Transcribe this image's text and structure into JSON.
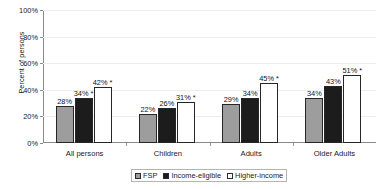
{
  "chart_data": {
    "type": "bar",
    "title": "",
    "xlabel": "",
    "ylabel": "Percent of persons",
    "ylim": [
      0,
      100
    ],
    "grid": true,
    "legend_position": "bottom",
    "categories": [
      "All persons",
      "Children",
      "Adults",
      "Older Adults"
    ],
    "ytick_labels": [
      "0%",
      "20%",
      "40%",
      "60%",
      "80%",
      "100%"
    ],
    "ytick_values": [
      0,
      20,
      40,
      60,
      80,
      100
    ],
    "series": [
      {
        "name": "FSP",
        "color": "#9d9d9d",
        "values": [
          28,
          22,
          29,
          34
        ],
        "labels": [
          "28%",
          "22%",
          "29%",
          "34%"
        ]
      },
      {
        "name": "Income-eligible",
        "color": "#1c1c1c",
        "values": [
          34,
          26,
          34,
          43
        ],
        "labels": [
          "34% *",
          "26%",
          "34%",
          "43%"
        ]
      },
      {
        "name": "Higher-income",
        "color": "#ffffff",
        "values": [
          42,
          31,
          45,
          51
        ],
        "labels": [
          "42% *",
          "31% *",
          "45% *",
          "51% *"
        ]
      }
    ],
    "annotations": [
      "* denotes statistically significant difference"
    ]
  },
  "legend": {
    "items": [
      {
        "label": "FSP"
      },
      {
        "label": "Income-eligible"
      },
      {
        "label": "Higher-income"
      }
    ]
  }
}
